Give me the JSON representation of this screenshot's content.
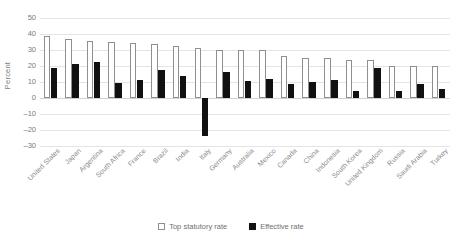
{
  "chart_data": {
    "type": "bar",
    "title": "",
    "xlabel": "",
    "ylabel": "Percent",
    "ylim": [
      -30,
      50
    ],
    "ytick_step": 10,
    "yticks": [
      50,
      40,
      30,
      20,
      10,
      0,
      -10,
      -20,
      -30
    ],
    "ytick_labels": [
      "50",
      "40",
      "30",
      "20",
      "10",
      "0",
      "–10",
      "–20",
      "–30"
    ],
    "grid": true,
    "legend_position": "bottom-center",
    "categories": [
      "United States",
      "Japan",
      "Argentina",
      "South Africa",
      "France",
      "Brazil",
      "India",
      "Italy",
      "Germany",
      "Australia",
      "Mexico",
      "Canada",
      "China",
      "Indonesia",
      "South Korea",
      "United Kingdom",
      "Russia",
      "Saudi Arabia",
      "Turkey"
    ],
    "series": [
      {
        "name": "Top statutory rate",
        "color": "#ffffff",
        "edge_color": "#8f8f8f",
        "values": [
          39,
          37,
          35.5,
          35,
          34.5,
          34,
          32.5,
          31.5,
          30,
          30,
          30,
          26,
          25,
          25,
          24,
          23.5,
          20,
          20,
          20
        ]
      },
      {
        "name": "Effective rate",
        "color": "#111111",
        "edge_color": "#111111",
        "values": [
          19,
          21.5,
          22.5,
          9.5,
          11,
          17.5,
          14,
          -24,
          16,
          10.5,
          12,
          9,
          10,
          11.5,
          4.5,
          19,
          4.5,
          8.5,
          5.5
        ]
      }
    ]
  },
  "legend": {
    "items": [
      {
        "label": "Top statutory rate",
        "swatch": "statutory"
      },
      {
        "label": "Effective rate",
        "swatch": "effective"
      }
    ]
  }
}
